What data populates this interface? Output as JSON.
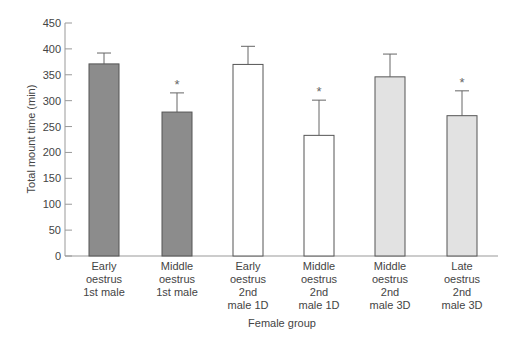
{
  "chart_data": {
    "type": "bar",
    "title": "",
    "xlabel": "Female group",
    "ylabel": "Total mount time (min)",
    "ylim": [
      0,
      450
    ],
    "yticks": [
      0,
      50,
      100,
      150,
      200,
      250,
      300,
      350,
      400,
      450
    ],
    "grid": false,
    "categories": [
      "Early oestrus 1st male",
      "Middle oestrus 1st male",
      "Early oestrus 2nd male 1D",
      "Middle oestrus 2nd male 1D",
      "Middle oestrus 2nd male 3D",
      "Late oestrus 2nd male 3D"
    ],
    "category_lines": [
      [
        "Early",
        "oestrus",
        "1st male"
      ],
      [
        "Middle",
        "oestrus",
        "1st male"
      ],
      [
        "Early",
        "oestrus",
        "2nd",
        "male 1D"
      ],
      [
        "Middle",
        "oestrus",
        "2nd",
        "male 1D"
      ],
      [
        "Middle",
        "oestrus",
        "2nd",
        "male 3D"
      ],
      [
        "Late",
        "oestrus",
        "2nd",
        "male 3D"
      ]
    ],
    "values": [
      371,
      278,
      370,
      233,
      346,
      271
    ],
    "error_upper": [
      392,
      315,
      405,
      301,
      390,
      319
    ],
    "significant": [
      false,
      true,
      false,
      true,
      false,
      true
    ],
    "annotation_symbol": "*",
    "fills": [
      "#8c8c8c",
      "#8c8c8c",
      "#ffffff",
      "#ffffff",
      "#e2e2e2",
      "#e2e2e2"
    ]
  }
}
